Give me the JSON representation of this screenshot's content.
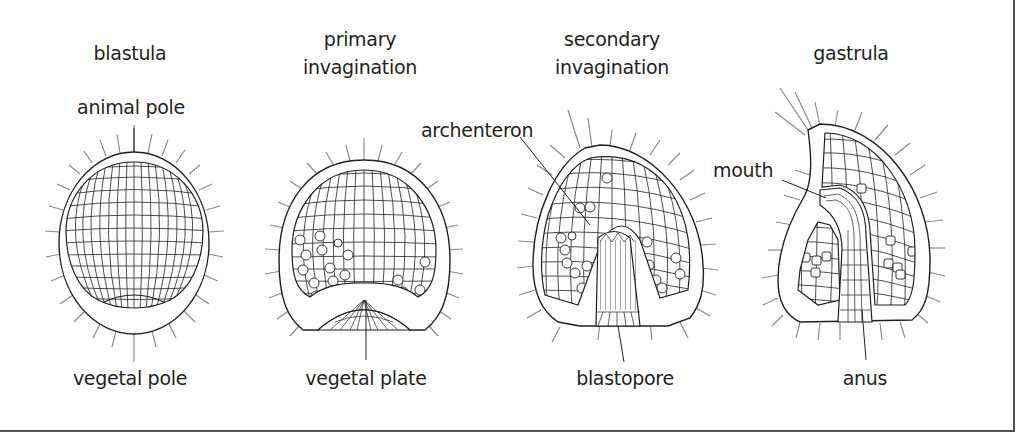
{
  "figure": {
    "stages": [
      {
        "id": "blastula",
        "title": "blastula",
        "labels": [
          "animal pole",
          "vegetal pole"
        ]
      },
      {
        "id": "primary",
        "title": "primary\ninvagination",
        "title_line1": "primary",
        "title_line2": "invagination",
        "labels": [
          "vegetal plate"
        ]
      },
      {
        "id": "secondary",
        "title_line1": "secondary",
        "title_line2": "invagination",
        "labels": [
          "archenteron",
          "blastopore"
        ]
      },
      {
        "id": "gastrula",
        "title": "gastrula",
        "labels": [
          "mouth",
          "anus"
        ]
      }
    ],
    "labels": {
      "blastula": "blastula",
      "primary_1": "primary",
      "primary_2": "invagination",
      "secondary_1": "secondary",
      "secondary_2": "invagination",
      "gastrula": "gastrula",
      "animal_pole": "animal pole",
      "vegetal_pole": "vegetal pole",
      "vegetal_plate": "vegetal plate",
      "archenteron": "archenteron",
      "blastopore": "blastopore",
      "mouth": "mouth",
      "anus": "anus"
    },
    "colors": {
      "line": "#231f20",
      "cilia": "#8a8a8a",
      "frame": "#555555",
      "background": "#ffffff"
    }
  }
}
